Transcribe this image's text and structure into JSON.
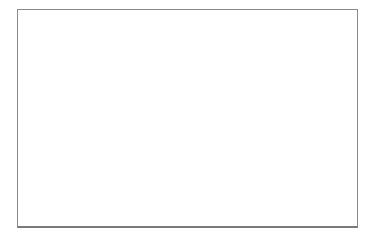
{
  "card": {
    "top_braille_row": {
      "description": "repeated full-cell braille pattern",
      "cell_count": 14,
      "cell_dots": [
        1,
        2,
        4,
        5
      ]
    },
    "word": "sit",
    "word_braille": [
      {
        "letter": "s",
        "dots": [
          2,
          3,
          4
        ]
      },
      {
        "letter": "i",
        "dots": [
          2,
          4
        ]
      },
      {
        "letter": "t",
        "dots": [
          2,
          3,
          4,
          5
        ]
      }
    ]
  }
}
